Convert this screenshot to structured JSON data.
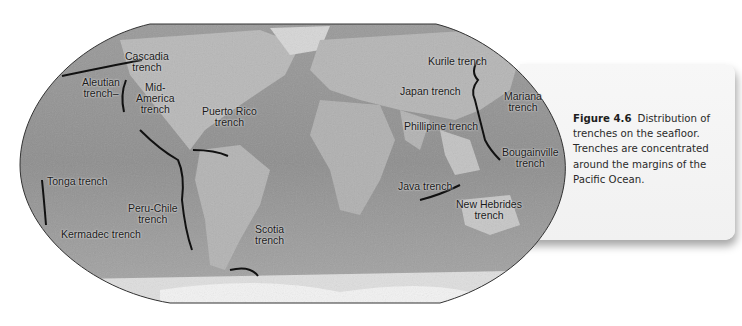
{
  "figure": {
    "number": "Figure 4.6",
    "caption": "Distribution of trenches on the seafloor. Trenches are concentrated around the margins of the Pacific Ocean.",
    "caption_lines": [
      "Distribution of",
      "trenches on the seafloor.",
      "Trenches are concentrated",
      "around the margins of the",
      "Pacific Ocean."
    ]
  },
  "map": {
    "type": "world shaded-relief map (grayscale)",
    "labels": [
      {
        "id": "cascadia",
        "lines": [
          "Cascadia",
          "trench"
        ],
        "x": 151,
        "y": 57
      },
      {
        "id": "aleutian",
        "lines": [
          "Aleutian",
          "trench–"
        ],
        "x": 103,
        "y": 82
      },
      {
        "id": "mid-america",
        "lines": [
          "Mid-",
          "America",
          "trench"
        ],
        "x": 157,
        "y": 82
      },
      {
        "id": "puerto-rico",
        "lines": [
          "Puerto Rico",
          "trench"
        ],
        "x": 229,
        "y": 111
      },
      {
        "id": "kurile",
        "lines": [
          "Kurile trench"
        ],
        "x": 456,
        "y": 61
      },
      {
        "id": "japan",
        "lines": [
          "Japan trench"
        ],
        "x": 431,
        "y": 91
      },
      {
        "id": "mariana",
        "lines": [
          "Mariana",
          "trench"
        ],
        "x": 529,
        "y": 97
      },
      {
        "id": "phillipine",
        "lines": [
          "Phillipine trench"
        ],
        "x": 445,
        "y": 126
      },
      {
        "id": "bougainville",
        "lines": [
          "Bougainville",
          "trench"
        ],
        "x": 523,
        "y": 154
      },
      {
        "id": "java",
        "lines": [
          "Java trench"
        ],
        "x": 426,
        "y": 186
      },
      {
        "id": "new-hebrides",
        "lines": [
          "New Hebrides",
          "trench"
        ],
        "x": 487,
        "y": 206
      },
      {
        "id": "tonga",
        "lines": [
          "Tonga trench"
        ],
        "x": 77,
        "y": 183
      },
      {
        "id": "peru-chile",
        "lines": [
          "Peru-Chile",
          "trench"
        ],
        "x": 152,
        "y": 209
      },
      {
        "id": "kermadec",
        "lines": [
          "Kermadec trench"
        ],
        "x": 99,
        "y": 234
      },
      {
        "id": "scotia",
        "lines": [
          "Scotia",
          "trench"
        ],
        "x": 269,
        "y": 231
      }
    ]
  }
}
